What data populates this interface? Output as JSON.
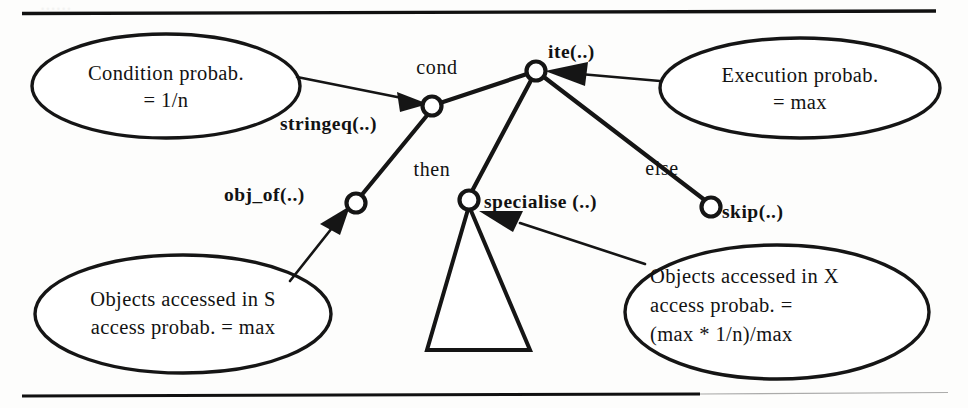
{
  "figure": {
    "background_color": "#fdfdfc",
    "ink_color": "#151515"
  },
  "rules": {
    "top_label": "top-horizontal-rule",
    "bottom_label": "bottom-horizontal-rule"
  },
  "tree": {
    "nodes": [
      {
        "id": "ite",
        "label": "ite(..)",
        "x": 536,
        "y": 71
      },
      {
        "id": "stringeq",
        "label": "stringeq(..)",
        "x": 432,
        "y": 106
      },
      {
        "id": "obj_of",
        "label": "obj_of(..)",
        "x": 356,
        "y": 203
      },
      {
        "id": "specialise",
        "label": "specialise (..)",
        "x": 469,
        "y": 200
      },
      {
        "id": "skip",
        "label": "skip(..)",
        "x": 711,
        "y": 207
      }
    ],
    "edge_labels": [
      {
        "id": "cond",
        "label": "cond",
        "x": 437,
        "y": 74
      },
      {
        "id": "then",
        "label": "then",
        "x": 432,
        "y": 176
      },
      {
        "id": "else",
        "label": "else",
        "x": 662,
        "y": 175
      }
    ],
    "subtree_placeholder": "elided-subtree-triangle"
  },
  "annotations": [
    {
      "id": "condition-probability",
      "lines": [
        "Condition probab.",
        "= 1/n"
      ],
      "cx": 166,
      "cy": 86,
      "rx": 134,
      "ry": 52,
      "target": "stringeq"
    },
    {
      "id": "execution-probability",
      "lines": [
        "Execution probab.",
        "= max"
      ],
      "cx": 800,
      "cy": 88,
      "rx": 140,
      "ry": 50,
      "target": "ite"
    },
    {
      "id": "objects-accessed-in-s",
      "lines": [
        "Objects accessed in S",
        "access probab. = max"
      ],
      "cx": 183,
      "cy": 314,
      "rx": 148,
      "ry": 59,
      "target": "obj_of"
    },
    {
      "id": "objects-accessed-in-x",
      "lines": [
        "Objects accessed in X",
        "access probab. =",
        "(max * 1/n)/max"
      ],
      "cx": 777,
      "cy": 312,
      "rx": 152,
      "ry": 67,
      "target": "specialise"
    }
  ]
}
